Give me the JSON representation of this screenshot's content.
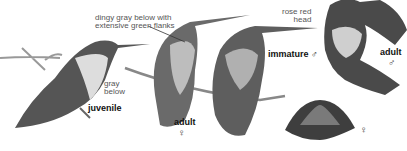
{
  "plate": {
    "subject": "hummingbird field guide plate",
    "figures": [
      {
        "id": "juvenile",
        "label": "juvenile",
        "note": "gray below"
      },
      {
        "id": "adult-female",
        "label": "adult",
        "sex_symbol": "♀",
        "note": "dingy gray below with extensive green flanks"
      },
      {
        "id": "immature-male",
        "label": "immature",
        "sex_symbol": "♂"
      },
      {
        "id": "adult-male",
        "label": "adult",
        "sex_symbol": "♂",
        "note": "rose red head"
      },
      {
        "id": "female-tail",
        "sex_symbol": "♀"
      }
    ],
    "annotations": {
      "dingy_line1": "dingy gray below with",
      "dingy_line2": "extensive green flanks",
      "gray_line1": "gray",
      "gray_line2": "below",
      "rose_line1": "rose red",
      "rose_line2": "head"
    },
    "labels": {
      "juvenile": "juvenile",
      "adult_female": "adult",
      "adult_female_sym": "♀",
      "immature_male": "immature ♂",
      "adult_male": "adult",
      "adult_male_sym": "♂",
      "tail_female_sym": "♀"
    }
  }
}
